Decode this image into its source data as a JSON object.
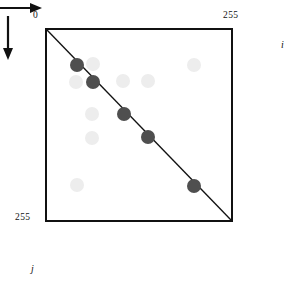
{
  "figure": {
    "type": "scatter",
    "axes": {
      "x": {
        "variable": "i",
        "origin_label": "0",
        "max_label": "255",
        "direction": "right",
        "range": [
          0,
          255
        ]
      },
      "y": {
        "variable": "j",
        "origin_label": "0",
        "max_label": "255",
        "direction": "down",
        "range": [
          0,
          255
        ]
      }
    },
    "diagonal": {
      "from": [
        0,
        0
      ],
      "to": [
        255,
        255
      ],
      "color": "#111111",
      "description": "identity line i = j"
    },
    "colors": {
      "border": "#111111",
      "diagonal": "#111111",
      "dot_dark": "#4f4f4f",
      "dot_light": "#ededed",
      "background": "#ffffff"
    }
  },
  "chart_data": {
    "type": "scatter",
    "title": "",
    "xlabel": "i",
    "ylabel": "j",
    "xlim": [
      0,
      255
    ],
    "ylim": [
      0,
      255
    ],
    "y_inverted": true,
    "grid": false,
    "legend": null,
    "series": [
      {
        "name": "dark-points",
        "color": "#4f4f4f",
        "radius": 7,
        "points": [
          {
            "i": 41,
            "j": 46
          },
          {
            "i": 62,
            "j": 68
          },
          {
            "i": 104,
            "j": 110
          },
          {
            "i": 137,
            "j": 141
          },
          {
            "i": 199,
            "j": 205
          }
        ]
      },
      {
        "name": "light-points",
        "color": "#ededed",
        "radius": 7,
        "points": [
          {
            "i": 62,
            "j": 45
          },
          {
            "i": 199,
            "j": 46
          },
          {
            "i": 39,
            "j": 68
          },
          {
            "i": 103,
            "j": 67
          },
          {
            "i": 137,
            "j": 67
          },
          {
            "i": 61,
            "j": 110
          },
          {
            "i": 61,
            "j": 142
          },
          {
            "i": 41,
            "j": 204
          }
        ]
      }
    ]
  },
  "labels": {
    "origin": "0",
    "x_max": "255",
    "y_max": "255",
    "x_var": "i",
    "y_var": "j"
  }
}
